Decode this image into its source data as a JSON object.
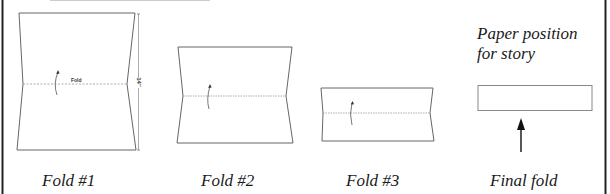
{
  "diagram": {
    "steps": [
      {
        "id": "fold1",
        "label": "Fold #1",
        "fold_text": "Fold",
        "dimension": "14\""
      },
      {
        "id": "fold2",
        "label": "Fold #2"
      },
      {
        "id": "fold3",
        "label": "Fold #3"
      },
      {
        "id": "final",
        "label": "Final fold"
      }
    ],
    "final_caption_line1": "Paper position",
    "final_caption_line2": "for story"
  },
  "colors": {
    "frame": "#222222",
    "outline": "#555555",
    "fold_line": "#888888",
    "arrow": "#111111"
  }
}
